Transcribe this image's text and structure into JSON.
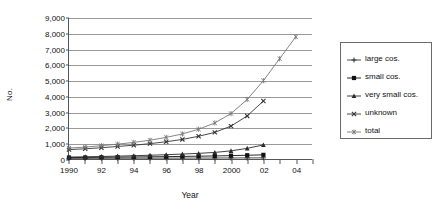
{
  "chart_data": {
    "type": "line",
    "title": "",
    "xlabel": "Year",
    "ylabel": "No.",
    "xlim": [
      1990,
      2005
    ],
    "ylim": [
      0,
      9000
    ],
    "ytick_step": 1000,
    "grid": true,
    "legend_position": "right",
    "ytick_labels": [
      "9,000",
      "8,000",
      "7,000",
      "6,000",
      "5,000",
      "4,000",
      "3,000",
      "2,000",
      "1,000",
      "0"
    ],
    "ytick_values": [
      9000,
      8000,
      7000,
      6000,
      5000,
      4000,
      3000,
      2000,
      1000,
      0
    ],
    "xtick_values": [
      1990,
      1991,
      1992,
      1993,
      1994,
      1995,
      1996,
      1997,
      1998,
      1999,
      2000,
      2001,
      2002,
      2003,
      2004,
      2005
    ],
    "xtick_labels": [
      "1990",
      "",
      "92",
      "",
      "94",
      "",
      "96",
      "",
      "98",
      "",
      "2000",
      "",
      "02",
      "",
      "04",
      ""
    ],
    "x": [
      1990,
      1991,
      1992,
      1993,
      1994,
      1995,
      1996,
      1997,
      1998,
      1999,
      2000,
      2001,
      2002,
      2003,
      2004
    ],
    "series": [
      {
        "name": "large cos.",
        "marker": "plus",
        "color": "#3a3a3a",
        "values": [
          40,
          42,
          45,
          48,
          50,
          52,
          55,
          58,
          60,
          63,
          66,
          70,
          74,
          null,
          null
        ]
      },
      {
        "name": "small cos.",
        "marker": "square",
        "color": "#111111",
        "values": [
          95,
          100,
          110,
          120,
          130,
          140,
          150,
          165,
          180,
          195,
          215,
          240,
          265,
          null,
          null
        ]
      },
      {
        "name": "very small cos.",
        "marker": "triangle",
        "color": "#2b2b2b",
        "values": [
          120,
          140,
          160,
          185,
          210,
          240,
          275,
          315,
          360,
          420,
          520,
          680,
          900,
          null,
          null
        ]
      },
      {
        "name": "unknown",
        "marker": "cross",
        "color": "#333333",
        "values": [
          600,
          650,
          720,
          800,
          880,
          980,
          1100,
          1250,
          1450,
          1700,
          2100,
          2750,
          3700,
          null,
          null
        ]
      },
      {
        "name": "total",
        "marker": "star",
        "color": "#777777",
        "values": [
          700,
          760,
          850,
          950,
          1060,
          1200,
          1380,
          1600,
          1900,
          2300,
          2900,
          3800,
          5000,
          6400,
          7800
        ]
      }
    ]
  },
  "legend": {
    "items": [
      {
        "label": "large cos."
      },
      {
        "label": "small cos."
      },
      {
        "label": "very small cos."
      },
      {
        "label": "unknown"
      },
      {
        "label": "total"
      }
    ]
  }
}
